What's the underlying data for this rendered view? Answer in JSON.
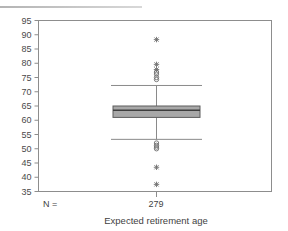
{
  "figure": {
    "top_rule": "horizontal-rule",
    "xlabel": "Expected retirement age",
    "n_label": "N =",
    "n_value": "279"
  },
  "chart_data": {
    "type": "box",
    "title": "",
    "xlabel": "Expected retirement age",
    "ylabel": "",
    "categories": [
      "Expected retirement age"
    ],
    "n": [
      279
    ],
    "ylim": [
      35,
      95
    ],
    "yticks": [
      35,
      40,
      45,
      50,
      55,
      60,
      65,
      70,
      75,
      80,
      85,
      90,
      95
    ],
    "ytick_labels": [
      "35",
      "40",
      "45",
      "50",
      "55",
      "60",
      "65",
      "70",
      "75",
      "80",
      "85",
      "90",
      "95"
    ],
    "grid": false,
    "legend": null,
    "box": {
      "q1": 61.0,
      "median": 63.5,
      "q3": 65.0,
      "whisker_low": 53.3,
      "whisker_high": 72.2
    },
    "outliers_circles": [
      76.2,
      75.0,
      74.3,
      76.9,
      52.0,
      51.2,
      50.6,
      50.0
    ],
    "outliers_stars": [
      88.3,
      79.6,
      77.8,
      43.5,
      37.5
    ],
    "colors": {
      "box_fill": "#a8a8a8",
      "box_stroke": "#5c5c5c",
      "median": "#3d3d3d",
      "whisker": "#8a8a8a",
      "frame": "#8d8d8d",
      "text": "#3f3f3f"
    }
  }
}
